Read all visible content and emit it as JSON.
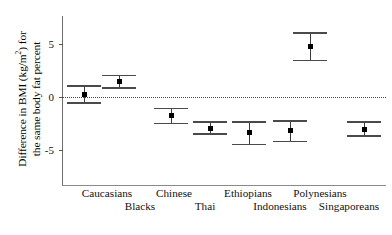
{
  "figure": {
    "background_color": "#ffffff",
    "marker_color": "#000000",
    "errorbar_color": "#4a4a4a",
    "axis_color": "#6d6d6d",
    "zero_line_color": "#4a4a4a"
  },
  "axis": {
    "ylabel_line_1": "Difference in BMI (kg/m",
    "ylabel_line_1_sup": "2",
    "ylabel_line_1_end": ") for",
    "ylabel_line_2": "the same body fat percent",
    "yticks": [
      {
        "value": 5,
        "label": "5"
      },
      {
        "value": 0,
        "label": "0"
      },
      {
        "value": -5,
        "label": "-5"
      }
    ],
    "ylim_min": -8.4,
    "ylim_max": 7.6
  },
  "chart_data": {
    "type": "scatter",
    "title": "",
    "xlabel": "",
    "ylabel": "Difference in BMI (kg/m2) for the same body fat percent",
    "ylim": [
      -8.4,
      7.6
    ],
    "yticks": [
      5,
      0,
      -5
    ],
    "grid": false,
    "legend": "none",
    "reference_line": {
      "y": 0,
      "style": "dotted"
    },
    "categories": [
      "Caucasians",
      "Blacks",
      "Chinese",
      "Thai",
      "Ethiopians",
      "Indonesians",
      "Polynesians",
      "Singaporeans"
    ],
    "values": [
      0.2,
      1.4,
      -1.8,
      -3.0,
      -3.4,
      -3.2,
      4.7,
      -3.1
    ],
    "ci_low": [
      -0.6,
      0.8,
      -2.5,
      -3.5,
      -4.5,
      -4.2,
      3.4,
      -3.7
    ],
    "ci_high": [
      1.0,
      2.0,
      -1.1,
      -2.4,
      -2.4,
      -2.3,
      6.0,
      -2.4
    ],
    "points": [
      {
        "category": "Caucasians",
        "x_pos": 22,
        "row": "top",
        "value": 0.2,
        "ci_low": -0.6,
        "ci_high": 1.0
      },
      {
        "category": "Blacks",
        "x_pos": 57,
        "row": "bottom",
        "value": 1.4,
        "ci_low": 0.8,
        "ci_high": 2.0
      },
      {
        "category": "Chinese",
        "x_pos": 109,
        "row": "top",
        "value": -1.8,
        "ci_low": -2.5,
        "ci_high": -1.1
      },
      {
        "category": "Thai",
        "x_pos": 148,
        "row": "bottom",
        "value": -3.0,
        "ci_low": -3.5,
        "ci_high": -2.4
      },
      {
        "category": "Ethiopians",
        "x_pos": 187,
        "row": "top",
        "value": -3.4,
        "ci_low": -4.5,
        "ci_high": -2.4
      },
      {
        "category": "Indonesians",
        "x_pos": 228,
        "row": "bottom",
        "value": -3.2,
        "ci_low": -4.2,
        "ci_high": -2.3
      },
      {
        "category": "Polynesians",
        "x_pos": 248,
        "row": "top",
        "value": 4.7,
        "ci_low": 3.4,
        "ci_high": 6.0
      },
      {
        "category": "Singaporeans",
        "x_pos": 302,
        "row": "bottom",
        "value": -3.1,
        "ci_low": -3.7,
        "ci_high": -2.4
      }
    ]
  },
  "xlabels": [
    {
      "text": "Caucasians",
      "row": "top",
      "center_px": 107
    },
    {
      "text": "Chinese",
      "row": "top",
      "center_px": 174
    },
    {
      "text": "Ethiopians",
      "row": "top",
      "center_px": 248
    },
    {
      "text": "Polynesians",
      "row": "top",
      "center_px": 320
    },
    {
      "text": "Blacks",
      "row": "bottom",
      "center_px": 140
    },
    {
      "text": "Thai",
      "row": "bottom",
      "center_px": 205
    },
    {
      "text": "Indonesians",
      "row": "bottom",
      "center_px": 280
    },
    {
      "text": "Singaporeans",
      "row": "bottom",
      "center_px": 349
    }
  ]
}
